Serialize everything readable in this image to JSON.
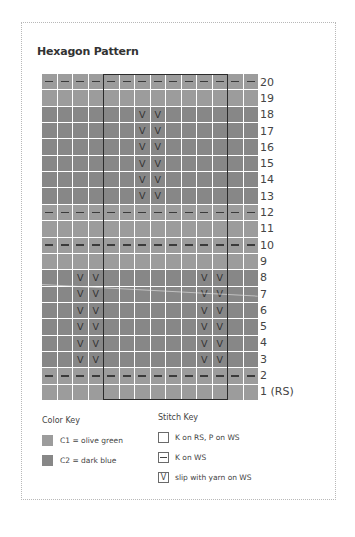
{
  "title": "Hexagon Pattern",
  "colors": {
    "c1": "#9c9c9c",
    "c2": "#878787",
    "frame": "#b8b8b8",
    "repeat_box": "#2b2b2b"
  },
  "chart": {
    "columns": 14,
    "rows": 20,
    "repeat_columns": [
      5,
      12
    ],
    "rows_top_to_bottom": [
      {
        "row": 20,
        "color": "c1",
        "stitches": "--------------"
      },
      {
        "row": 19,
        "color": "c1",
        "stitches": "              "
      },
      {
        "row": 18,
        "color": "c2",
        "stitches": "      VV      "
      },
      {
        "row": 17,
        "color": "c2",
        "stitches": "      VV      "
      },
      {
        "row": 16,
        "color": "c2",
        "stitches": "      VV      "
      },
      {
        "row": 15,
        "color": "c2",
        "stitches": "      VV      "
      },
      {
        "row": 14,
        "color": "c2",
        "stitches": "      VV      "
      },
      {
        "row": 13,
        "color": "c2",
        "stitches": "      VV      "
      },
      {
        "row": 12,
        "color": "c1",
        "stitches": "--------------"
      },
      {
        "row": 11,
        "color": "c1",
        "stitches": "              "
      },
      {
        "row": 10,
        "color": "c1",
        "stitches": "--------------"
      },
      {
        "row": 9,
        "color": "c1",
        "stitches": "              "
      },
      {
        "row": 8,
        "color": "c2",
        "stitches": "  VV      VV  "
      },
      {
        "row": 7,
        "color": "c2",
        "stitches": "  VV      VV  "
      },
      {
        "row": 6,
        "color": "c2",
        "stitches": "  VV      VV  "
      },
      {
        "row": 5,
        "color": "c2",
        "stitches": "  VV      VV  "
      },
      {
        "row": 4,
        "color": "c2",
        "stitches": "  VV      VV  "
      },
      {
        "row": 3,
        "color": "c2",
        "stitches": "  VV      VV  "
      },
      {
        "row": 2,
        "color": "c1",
        "stitches": "--------------"
      },
      {
        "row": 1,
        "color": "c1",
        "stitches": "              "
      }
    ],
    "row_labels": [
      "20",
      "19",
      "18",
      "17",
      "16",
      "15",
      "14",
      "13",
      "12",
      "11",
      "10",
      "9",
      "8",
      "7",
      "6",
      "5",
      "4",
      "3",
      "2",
      "1 (RS)"
    ]
  },
  "color_key": {
    "title": "Color Key",
    "items": [
      {
        "label": "C1 = olive green",
        "color": "c1"
      },
      {
        "label": "C2 = dark blue",
        "color": "c2"
      }
    ]
  },
  "stitch_key": {
    "title": "Stitch Key",
    "items": [
      {
        "symbol": "blank",
        "glyph": "",
        "label": "K on RS, P on WS"
      },
      {
        "symbol": "dash",
        "glyph": "—",
        "label": "K on WS"
      },
      {
        "symbol": "v",
        "glyph": "V",
        "label": "slip with yarn on WS"
      }
    ]
  }
}
